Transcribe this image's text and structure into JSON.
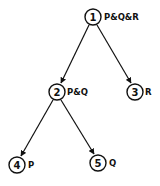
{
  "diagram": {
    "type": "tree",
    "nodes": [
      {
        "id": 1,
        "number": "1",
        "label": "P&Q&R",
        "cx": 93,
        "cy": 17
      },
      {
        "id": 2,
        "number": "2",
        "label": "P&Q",
        "cx": 57,
        "cy": 92
      },
      {
        "id": 3,
        "number": "3",
        "label": "R",
        "cx": 135,
        "cy": 92
      },
      {
        "id": 4,
        "number": "4",
        "label": "P",
        "cx": 17,
        "cy": 165
      },
      {
        "id": 5,
        "number": "5",
        "label": "Q",
        "cx": 98,
        "cy": 163
      }
    ],
    "edges": [
      {
        "from": 1,
        "to": 2
      },
      {
        "from": 1,
        "to": 3
      },
      {
        "from": 2,
        "to": 4
      },
      {
        "from": 2,
        "to": 5
      }
    ],
    "colors": {
      "line": "#111111",
      "background": "#ffffff"
    }
  }
}
